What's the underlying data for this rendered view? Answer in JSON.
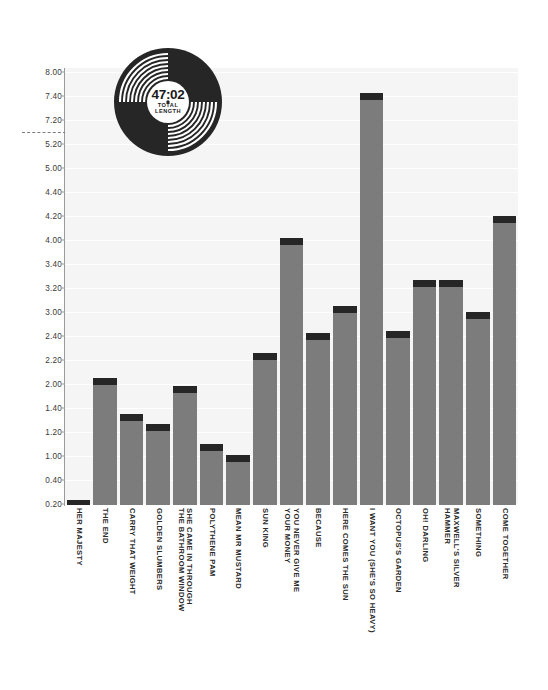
{
  "chart_data": {
    "type": "bar",
    "title": "",
    "subtitle": "",
    "xlabel": "",
    "ylabel": "",
    "grid": true,
    "legend": "none",
    "axis_tick_labels": [
      "8.00",
      "7.40",
      "7.20",
      "5.20",
      "5.00",
      "4.40",
      "4.20",
      "4.00",
      "3.40",
      "3.20",
      "3.00",
      "2.40",
      "2.20",
      "2.00",
      "1.40",
      "1.20",
      "1.00",
      "0.40",
      "0.20"
    ],
    "axis_break": true,
    "categories": [
      "HER MAJESTY",
      "THE END",
      "CARRY THAT WEIGHT",
      "GOLDEN SLUMBERS",
      "SHE CAME IN THROUGH\nTHE BATHROOM WINDOW",
      "POLYTHENE PAM",
      "MEAN MR MUSTARD",
      "SUN KING",
      "YOU NEVER GIVE ME\nYOUR MONEY",
      "BECAUSE",
      "HERE COMES THE SUN",
      "I WANT YOU (SHE'S SO HEAVY)",
      "OCTOPUS'S GARDEN",
      "OH! DARLING",
      "MAXWELL'S SILVER\nHAMMER",
      "SOMETHING",
      "COME TOGETHER"
    ],
    "values": [
      0.23,
      2.05,
      1.35,
      1.27,
      1.96,
      1.1,
      1.01,
      2.26,
      4.02,
      2.47,
      3.05,
      7.47,
      2.52,
      3.27,
      3.27,
      3.0,
      4.2
    ],
    "ylim": [
      0.2,
      8.2
    ],
    "bar_color": "#7c7c7c",
    "bar_cap_color": "#262626",
    "plot_background": "#f5f5f5",
    "gridline_color": "#ffffff"
  },
  "record": {
    "time": "47:02",
    "caption_line1": "TOTAL",
    "caption_line2": "LENGTH"
  }
}
